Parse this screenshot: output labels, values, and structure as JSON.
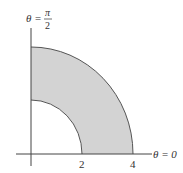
{
  "diagram": {
    "type": "polar-region",
    "inner_radius": 2,
    "outer_radius": 4,
    "theta_start": "0",
    "theta_end": "pi/2",
    "labels": {
      "top_axis_theta": "θ =",
      "top_axis_frac_num": "π",
      "top_axis_frac_den": "2",
      "right_axis": "θ = 0",
      "tick_inner": "2",
      "tick_outer": "4"
    },
    "colors": {
      "fill": "#d3d3d3",
      "stroke": "#555555",
      "axis": "#444444"
    }
  }
}
